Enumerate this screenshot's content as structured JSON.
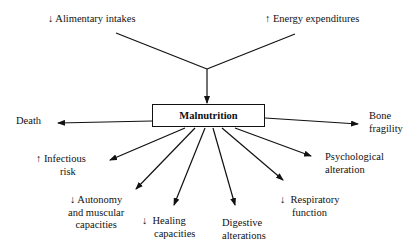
{
  "diagram": {
    "center": "Malnutrition",
    "causes": [
      {
        "arrow": "↓",
        "label": "Alimentary intakes"
      },
      {
        "arrow": "↑",
        "label": "Energy expenditures"
      }
    ],
    "consequences": [
      {
        "id": "death",
        "arrow": "",
        "line1": "Death",
        "line2": ""
      },
      {
        "id": "bone",
        "arrow": "",
        "line1": "Bone",
        "line2": "fragility"
      },
      {
        "id": "infectious",
        "arrow": "↑",
        "line1": "Infectious",
        "line2": "risk"
      },
      {
        "id": "psych",
        "arrow": "",
        "line1": "Psychological",
        "line2": "alteration"
      },
      {
        "id": "autonomy",
        "arrow": "↓",
        "line1": "Autonomy",
        "line2": "and muscular",
        "line3": "capacities"
      },
      {
        "id": "healing",
        "arrow": "↓",
        "line1": "Healing",
        "line2": "capacities"
      },
      {
        "id": "digestive",
        "arrow": "",
        "line1": "Digestive",
        "line2": "alterations"
      },
      {
        "id": "respiratory",
        "arrow": "↓",
        "line1": "Respiratory",
        "line2": "function"
      }
    ]
  }
}
